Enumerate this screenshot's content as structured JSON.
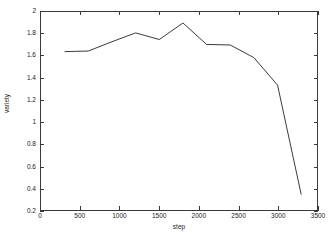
{
  "chart_data": {
    "type": "line",
    "title": "",
    "xlabel": "step",
    "ylabel": "variety",
    "xlim": [
      0,
      3500
    ],
    "ylim": [
      0.2,
      2
    ],
    "grid": false,
    "legend": null,
    "xticks": [
      0,
      500,
      1000,
      1500,
      2000,
      2500,
      3000,
      3500
    ],
    "xtick_labels": [
      "0",
      "500",
      "1000",
      "1500",
      "2000",
      "2500",
      "3000",
      "3500"
    ],
    "yticks": [
      0.2,
      0.4,
      0.6,
      0.8,
      1,
      1.2,
      1.4,
      1.6,
      1.8,
      2
    ],
    "ytick_labels": [
      "0.2",
      "0.4",
      "0.6",
      "0.8",
      "1",
      "1.2",
      "1.4",
      "1.6",
      "1.8",
      "2"
    ],
    "line_color": "#3a3a3a",
    "series": [
      {
        "name": "variety",
        "x": [
          300,
          600,
          900,
          1200,
          1500,
          1800,
          2100,
          2400,
          2700,
          3000,
          3300
        ],
        "values": [
          1.64,
          1.645,
          1.73,
          1.81,
          1.75,
          1.9,
          1.705,
          1.7,
          1.585,
          1.335,
          0.34
        ]
      }
    ]
  }
}
